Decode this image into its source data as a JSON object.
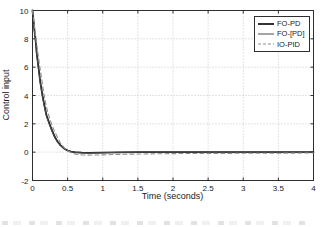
{
  "figure": {
    "background": "#ffffff",
    "axis_color": "#2e2e2e",
    "grid_color": "#c9c9c9",
    "text_color": "#1c1c1c"
  },
  "chart_data": {
    "type": "line",
    "title": "",
    "xlabel": "Time (seconds)",
    "ylabel": "Control input",
    "xlim": [
      0,
      4
    ],
    "ylim": [
      -2,
      10
    ],
    "xticks": [
      0,
      0.5,
      1,
      1.5,
      2,
      2.5,
      3,
      3.5,
      4
    ],
    "yticks": [
      -2,
      0,
      2,
      4,
      6,
      8,
      10
    ],
    "grid": true,
    "grid_style": "dotted",
    "legend_position": "top-right",
    "series": [
      {
        "name": "FO-PD",
        "style": "solid",
        "color": "#1c1c1c",
        "width": 1.8,
        "x": [
          0,
          0.01,
          0.02,
          0.03,
          0.043,
          0.06,
          0.085,
          0.11,
          0.142,
          0.17,
          0.2,
          0.242,
          0.28,
          0.32,
          0.36,
          0.4,
          0.45,
          0.5,
          0.55,
          0.6,
          0.7,
          0.8,
          1.0,
          1.2,
          1.5,
          2.0,
          2.5,
          3.0,
          3.5,
          4.0
        ],
        "y": [
          10,
          9.5,
          9.0,
          8.5,
          8.0,
          7.0,
          6.0,
          5.0,
          4.0,
          3.3,
          2.6,
          2.0,
          1.5,
          1.05,
          0.72,
          0.48,
          0.26,
          0.12,
          0.04,
          0.0,
          -0.04,
          -0.05,
          -0.03,
          -0.01,
          0,
          0,
          0,
          0,
          0,
          0
        ]
      },
      {
        "name": "FO-[PD]",
        "style": "solid",
        "color": "#4a4a4a",
        "width": 1.0,
        "x": [
          0,
          0.01,
          0.02,
          0.03,
          0.043,
          0.06,
          0.085,
          0.11,
          0.142,
          0.17,
          0.2,
          0.242,
          0.28,
          0.32,
          0.36,
          0.4,
          0.45,
          0.5,
          0.55,
          0.6,
          0.7,
          0.8,
          1.0,
          1.2,
          1.5,
          2.0,
          2.5,
          3.0,
          3.5,
          4.0
        ],
        "y": [
          10,
          9.45,
          8.92,
          8.4,
          7.9,
          6.88,
          5.88,
          4.9,
          3.9,
          3.2,
          2.52,
          1.93,
          1.44,
          1.0,
          0.68,
          0.45,
          0.24,
          0.1,
          0.03,
          -0.01,
          -0.05,
          -0.06,
          -0.04,
          -0.02,
          0,
          0,
          0,
          0,
          0,
          0
        ]
      },
      {
        "name": "IO-PID",
        "style": "dashed",
        "color": "#8f8f8f",
        "width": 1.1,
        "x": [
          0,
          0.01,
          0.02,
          0.03,
          0.05,
          0.08,
          0.1,
          0.13,
          0.16,
          0.19,
          0.22,
          0.27,
          0.31,
          0.35,
          0.4,
          0.45,
          0.5,
          0.55,
          0.6,
          0.7,
          0.8,
          0.9,
          1.0,
          1.2,
          1.5,
          2.0,
          2.5,
          3.0,
          3.5,
          4.0
        ],
        "y": [
          10,
          9.6,
          9.2,
          8.8,
          8.0,
          6.9,
          6.2,
          5.2,
          4.2,
          3.4,
          2.75,
          2.0,
          1.5,
          1.1,
          0.62,
          0.32,
          0.1,
          -0.04,
          -0.12,
          -0.19,
          -0.21,
          -0.2,
          -0.19,
          -0.16,
          -0.13,
          -0.1,
          -0.09,
          -0.08,
          -0.07,
          -0.06
        ]
      }
    ]
  }
}
